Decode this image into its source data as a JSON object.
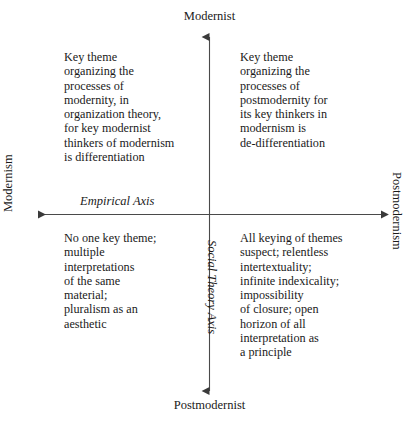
{
  "diagram": {
    "axes": {
      "vertical": {
        "name": "Social Theory Axis",
        "top_pole": "Modernist",
        "bottom_pole": "Postmodernist"
      },
      "horizontal": {
        "name": "Empirical Axis",
        "left_pole": "Modernism",
        "right_pole": "Postmodernism"
      }
    },
    "quadrants": {
      "top_left": "Key theme\norganizing the\nprocesses of\nmodernity, in\norganization theory,\nfor key modernist\nthinkers of modernism\nis differentiation",
      "top_right": "Key theme\norganizing the\nprocesses of\npostmodernity for\nits key thinkers in\nmodernism is\nde-differentiation",
      "bottom_left": "No one key theme;\nmultiple\ninterpretations\nof the same\nmaterial;\npluralism as an\naesthetic",
      "bottom_right": "All keying of themes\nsuspect; relentless\nintertextuality;\ninfinite indexicality;\nimpossibility\nof closure; open\nhorizon of all\ninterpretation as\na principle"
    },
    "colors": {
      "text": "#1a1a1a",
      "axis_line": "#4a4a4a",
      "background": "#ffffff"
    }
  }
}
